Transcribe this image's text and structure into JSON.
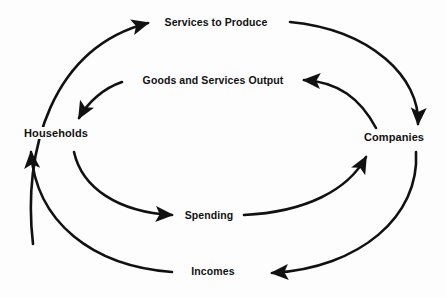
{
  "diagram": {
    "type": "circular-flow",
    "background_color": "#fdfdfd",
    "stroke_color": "#111111",
    "nodes": [
      {
        "id": "households",
        "label": "Households",
        "position": "left"
      },
      {
        "id": "companies",
        "label": "Companies",
        "position": "right"
      }
    ],
    "flows": [
      {
        "id": "services-to-produce",
        "label": "Services to Produce",
        "from": "households",
        "to": "companies",
        "loop": "outer",
        "position": "top",
        "direction": "left-to-right"
      },
      {
        "id": "goods-services-output",
        "label": "Goods and Services Output",
        "from": "companies",
        "to": "households",
        "loop": "inner",
        "position": "upper-middle",
        "direction": "right-to-left"
      },
      {
        "id": "spending",
        "label": "Spending",
        "from": "households",
        "to": "companies",
        "loop": "inner",
        "position": "lower-middle",
        "direction": "left-to-right"
      },
      {
        "id": "incomes",
        "label": "Incomes",
        "from": "companies",
        "to": "households",
        "loop": "outer",
        "position": "bottom",
        "direction": "right-to-left"
      }
    ],
    "arrowheads": [
      {
        "id": "arrow-services-to-produce",
        "points": "right",
        "at": "services-to-produce-label-left"
      },
      {
        "id": "arrow-to-companies-top",
        "points": "down",
        "at": "companies-top"
      },
      {
        "id": "arrow-goods-services-output",
        "points": "left",
        "at": "goods-services-output-label-right"
      },
      {
        "id": "arrow-to-households-inner",
        "points": "down-left",
        "at": "households-top"
      },
      {
        "id": "arrow-spending",
        "points": "right",
        "at": "spending-label-left"
      },
      {
        "id": "arrow-to-companies-inner",
        "points": "up-right",
        "at": "companies-bottom"
      },
      {
        "id": "arrow-incomes",
        "points": "left",
        "at": "incomes-label-right"
      },
      {
        "id": "arrow-to-households-outer",
        "points": "up",
        "at": "households-bottom"
      }
    ]
  }
}
